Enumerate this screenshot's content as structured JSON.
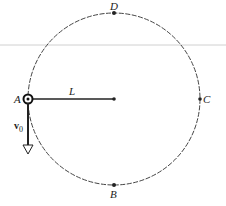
{
  "diagram": {
    "type": "vertical circular motion",
    "circle": {
      "cx": 114,
      "cy": 99,
      "r": 86,
      "style": "dashed"
    },
    "points": [
      {
        "id": "A",
        "label": "A",
        "x": 28,
        "y": 99
      },
      {
        "id": "B",
        "label": "B",
        "x": 114,
        "y": 185
      },
      {
        "id": "C",
        "label": "C",
        "x": 200,
        "y": 99
      },
      {
        "id": "D",
        "label": "D",
        "x": 114,
        "y": 13
      }
    ],
    "radius_label": "L",
    "velocity_label": "v",
    "velocity_subscript": "0",
    "colors": {
      "line": "#333333",
      "rule": "#cccccc"
    }
  }
}
